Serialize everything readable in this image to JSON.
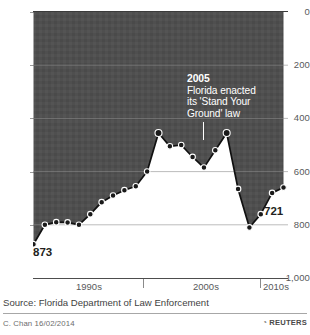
{
  "chart_data": {
    "type": "line",
    "title": "",
    "subtitle": "",
    "xlabel": "",
    "ylabel": "",
    "ylim": [
      1000,
      0
    ],
    "y_axis_inverted": true,
    "grid": true,
    "legend": "none",
    "yticks": [
      "0",
      "200",
      "400",
      "600",
      "800",
      "1,000"
    ],
    "ytick_values": [
      0,
      200,
      400,
      600,
      800,
      1000
    ],
    "xticks": [
      "1990s",
      "2000s",
      "2010s"
    ],
    "xtick_values": [
      1995,
      2005,
      2011
    ],
    "x": [
      1990,
      1991,
      1992,
      1993,
      1994,
      1995,
      1996,
      1997,
      1998,
      1999,
      2000,
      2001,
      2002,
      2003,
      2004,
      2005,
      2006,
      2007,
      2008,
      2009,
      2010,
      2011,
      2012
    ],
    "values": [
      873,
      800,
      790,
      791,
      800,
      760,
      715,
      690,
      670,
      655,
      600,
      455,
      505,
      500,
      545,
      585,
      520,
      455,
      665,
      810,
      760,
      680,
      660
    ],
    "series": [
      {
        "name": "Gun deaths in Florida",
        "values": [
          873,
          800,
          790,
          791,
          800,
          760,
          715,
          690,
          670,
          655,
          600,
          455,
          505,
          500,
          545,
          585,
          520,
          455,
          665,
          810,
          760,
          680,
          660
        ]
      }
    ],
    "start_label": "873",
    "end_label": "721",
    "annotations": [
      {
        "year": "2005",
        "text_lines": [
          "Florida enacted",
          "its 'Stand Your",
          "Ground' law"
        ],
        "x": 2005
      }
    ],
    "colors": {
      "fill": "#4f4f4f",
      "line": "#1a1a1a",
      "marker_fill": "#1a1a1a",
      "marker_edge": "#ffffff",
      "background": "#ffffff",
      "grid": "#8f8f8f",
      "text": "#231f20",
      "annotation_text": "#ffffff"
    }
  },
  "footer": {
    "source": "Source: Florida Department of Law Enforcement",
    "credit": "C. Chan  16/02/2014",
    "brand": "REUTERS",
    "brand_mark": "◔"
  }
}
